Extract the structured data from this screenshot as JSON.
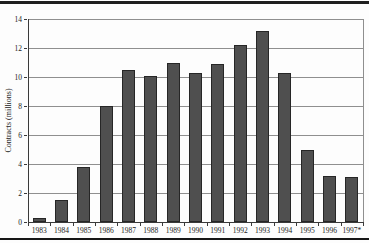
{
  "figure": {
    "background": "#fdfdfd",
    "top_rule_color": "#1f1f1f",
    "bottom_rule_color": "#161616"
  },
  "chart_data": {
    "type": "bar",
    "title": "",
    "xlabel": "",
    "ylabel": "Contracts (millions)",
    "categories": [
      "1983",
      "1984",
      "1985",
      "1986",
      "1987",
      "1988",
      "1989",
      "1990",
      "1991",
      "1992",
      "1993",
      "1994",
      "1995",
      "1996",
      "1997*"
    ],
    "values": [
      0.3,
      1.5,
      3.8,
      8.0,
      10.5,
      10.1,
      11.0,
      10.3,
      10.9,
      12.2,
      13.2,
      10.3,
      5.0,
      3.2,
      3.1
    ],
    "ylim": [
      0,
      14
    ],
    "yticks": [
      0,
      2,
      4,
      6,
      8,
      10,
      12,
      14
    ],
    "grid": true,
    "legend": "none",
    "bar_color": "#4f4f4f",
    "bar_border_color": "#262626",
    "gridline_color": "#8f8f8f"
  }
}
